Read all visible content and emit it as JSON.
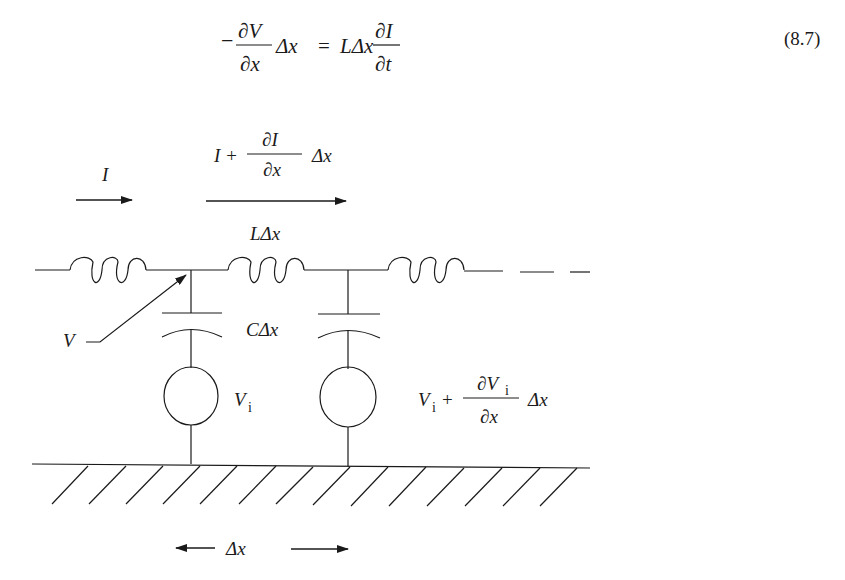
{
  "equation": {
    "number": "(8.7)",
    "lhs_sign": "−",
    "lhs_num": "∂V",
    "lhs_den": "∂x",
    "lhs_tail": "Δx",
    "equals": "=",
    "rhs_head": "LΔx",
    "rhs_num": "∂I",
    "rhs_den": "∂t"
  },
  "diagram": {
    "current_in": "I",
    "current_out_prefix": "I +",
    "current_out_num": "∂I",
    "current_out_den": "∂x",
    "current_out_tail": "Δx",
    "inductor_label": "LΔx",
    "capacitor_label": "CΔx",
    "voltage_label": "V",
    "source1_label": "V",
    "source1_sub": "i",
    "source2_prefix": "V",
    "source2_prefix_sub": "i",
    "source2_plus": "+",
    "source2_num": "∂V",
    "source2_num_sub": "i",
    "source2_den": "∂x",
    "source2_tail": "Δx",
    "spacing_label": "Δx"
  }
}
